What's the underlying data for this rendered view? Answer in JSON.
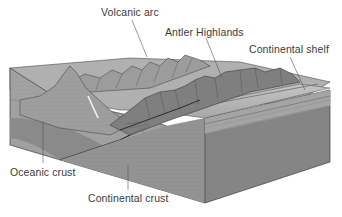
{
  "diagram": {
    "type": "geologic-block-diagram",
    "colors": {
      "background": "#ffffff",
      "continental_crust": "#8e8e8e",
      "continental_crust_right": "#858585",
      "oceanic_crust": "#9a9a9a",
      "oceanic_layer": "#7e7e7e",
      "upper_left_face": "#a6a6a6",
      "top_surface": "#b4b4b4",
      "mountains": "#8a8a8a",
      "mountain_ridges": "#5a5a5a",
      "shelf_top": "#bdbdbd",
      "sediment_layer": "#a0a0a0",
      "outline": "#3c3c3c",
      "label_text": "#3a3a3a",
      "leader_line": "#555555"
    },
    "labels": {
      "volcanic_arc": "Volcanic arc",
      "antler_highlands": "Antler Highlands",
      "continental_shelf": "Continental shelf",
      "oceanic_crust": "Oceanic crust",
      "continental_crust": "Continental crust"
    }
  }
}
